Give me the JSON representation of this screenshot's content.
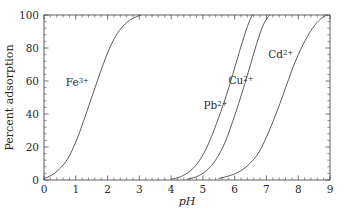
{
  "chart_data": {
    "type": "line",
    "title": "",
    "xlabel": "pH",
    "ylabel": "Percent adsorption",
    "xlim": [
      0,
      9
    ],
    "ylim": [
      0,
      100
    ],
    "xticks": [
      0,
      1,
      2,
      3,
      4,
      5,
      6,
      7,
      8,
      9
    ],
    "xticklabels": [
      "0",
      "1",
      "2",
      "3",
      "4",
      "5",
      "6",
      "7",
      "8",
      "9"
    ],
    "yticks": [
      0,
      20,
      40,
      60,
      80,
      100
    ],
    "yticklabels": [
      "0",
      "20",
      "40",
      "60",
      "80",
      "100"
    ],
    "grid": false,
    "legend_position": "inline-annotations",
    "minor_ticks": true,
    "series": [
      {
        "name": "Fe3+",
        "label_base": "Fe",
        "label_sup": "3+",
        "label_x": 1.05,
        "label_y": 57,
        "midpoint_pH": 1.5,
        "slope": 1.55,
        "x_start": 0.0,
        "x_end": 3.05,
        "points": [
          {
            "x": 0.0,
            "y": 1.0
          },
          {
            "x": 0.25,
            "y": 3.0
          },
          {
            "x": 0.5,
            "y": 7.0
          },
          {
            "x": 0.75,
            "y": 13.0
          },
          {
            "x": 1.0,
            "y": 23.0
          },
          {
            "x": 1.25,
            "y": 36.0
          },
          {
            "x": 1.5,
            "y": 50.0
          },
          {
            "x": 1.75,
            "y": 64.0
          },
          {
            "x": 2.0,
            "y": 77.0
          },
          {
            "x": 2.25,
            "y": 87.0
          },
          {
            "x": 2.5,
            "y": 93.5
          },
          {
            "x": 2.75,
            "y": 97.5
          },
          {
            "x": 3.05,
            "y": 100.0
          }
        ]
      },
      {
        "name": "Pb2+",
        "label_base": "Pb",
        "label_sup": "2+",
        "label_x": 5.4,
        "label_y": 43,
        "midpoint_pH": 5.75,
        "slope": 3.3,
        "x_start": 4.0,
        "x_end": 6.55,
        "points": [
          {
            "x": 4.0,
            "y": 0.5
          },
          {
            "x": 4.3,
            "y": 2.0
          },
          {
            "x": 4.6,
            "y": 5.5
          },
          {
            "x": 4.9,
            "y": 12.0
          },
          {
            "x": 5.2,
            "y": 23.0
          },
          {
            "x": 5.5,
            "y": 38.0
          },
          {
            "x": 5.75,
            "y": 52.0
          },
          {
            "x": 6.0,
            "y": 68.0
          },
          {
            "x": 6.2,
            "y": 81.0
          },
          {
            "x": 6.4,
            "y": 93.0
          },
          {
            "x": 6.55,
            "y": 100.0
          }
        ]
      },
      {
        "name": "Cu2+",
        "label_base": "Cu",
        "label_sup": "2+",
        "label_x": 6.2,
        "label_y": 58,
        "midpoint_pH": 6.2,
        "slope": 3.1,
        "x_start": 4.5,
        "x_end": 7.1,
        "points": [
          {
            "x": 4.5,
            "y": 0.5
          },
          {
            "x": 4.8,
            "y": 2.0
          },
          {
            "x": 5.1,
            "y": 5.5
          },
          {
            "x": 5.4,
            "y": 12.0
          },
          {
            "x": 5.7,
            "y": 23.0
          },
          {
            "x": 6.0,
            "y": 39.0
          },
          {
            "x": 6.25,
            "y": 54.0
          },
          {
            "x": 6.5,
            "y": 70.0
          },
          {
            "x": 6.7,
            "y": 83.0
          },
          {
            "x": 6.9,
            "y": 94.0
          },
          {
            "x": 7.1,
            "y": 100.0
          }
        ]
      },
      {
        "name": "Cd2+",
        "label_base": "Cd",
        "label_sup": "2+",
        "label_x": 7.45,
        "label_y": 74,
        "midpoint_pH": 7.55,
        "slope": 2.15,
        "x_start": 5.5,
        "x_end": 8.9,
        "points": [
          {
            "x": 5.5,
            "y": 1.0
          },
          {
            "x": 5.9,
            "y": 3.0
          },
          {
            "x": 6.3,
            "y": 7.0
          },
          {
            "x": 6.7,
            "y": 15.0
          },
          {
            "x": 7.0,
            "y": 26.0
          },
          {
            "x": 7.3,
            "y": 40.0
          },
          {
            "x": 7.55,
            "y": 53.0
          },
          {
            "x": 7.85,
            "y": 69.0
          },
          {
            "x": 8.15,
            "y": 82.0
          },
          {
            "x": 8.45,
            "y": 92.0
          },
          {
            "x": 8.7,
            "y": 97.5
          },
          {
            "x": 8.9,
            "y": 100.0
          }
        ]
      }
    ]
  },
  "figure": {
    "axis_color": "#3a3a3a",
    "curve_color": "#4a4a4a",
    "text_color": "#2b2b2b",
    "background": "#ffffff"
  }
}
